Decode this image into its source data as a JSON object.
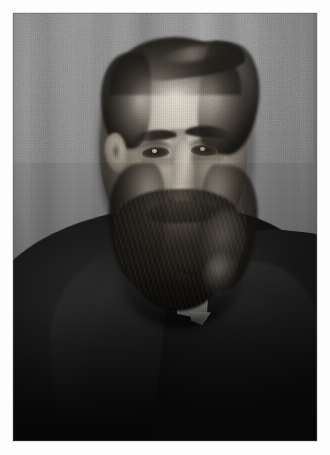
{
  "page": {
    "background_color": "#ffffff",
    "width": 330,
    "height": 455,
    "caption": ""
  },
  "photograph": {
    "kind": "photograph",
    "medium": "black-and-white halftone print",
    "orientation": "portrait",
    "subject": "bearded balding man in dark suit, three-quarter view",
    "frame": {
      "left": 13,
      "top": 13,
      "width": 304,
      "height": 428,
      "border_color": "#787878"
    },
    "tones": {
      "background_gray": "#7a7a7a",
      "highlight": "#ece8df",
      "midtone": "#8d8578",
      "shadow": "#2a2a2a",
      "deep_black": "#0b0b0b",
      "collar_white": "#ededea"
    },
    "regions": [
      {
        "name": "background-curtain",
        "description": "mottled gray studio drape with soft vertical folds"
      },
      {
        "name": "head",
        "description": "balding forehead catching the key light, dark hair at the temples"
      },
      {
        "name": "hair",
        "description": "dark hair swept back above the ears"
      },
      {
        "name": "eyes",
        "description": "deep-set eyes looking toward the viewer"
      },
      {
        "name": "eyebrows",
        "description": "heavy dark brows"
      },
      {
        "name": "nose",
        "description": "prominent nose with lit bridge"
      },
      {
        "name": "beard",
        "description": "full dark beard and moustache covering jaw and chin"
      },
      {
        "name": "collar",
        "description": "bright white stand collar wedge below the beard"
      },
      {
        "name": "suit",
        "description": "black jacket filling the lower half of the frame"
      }
    ]
  }
}
